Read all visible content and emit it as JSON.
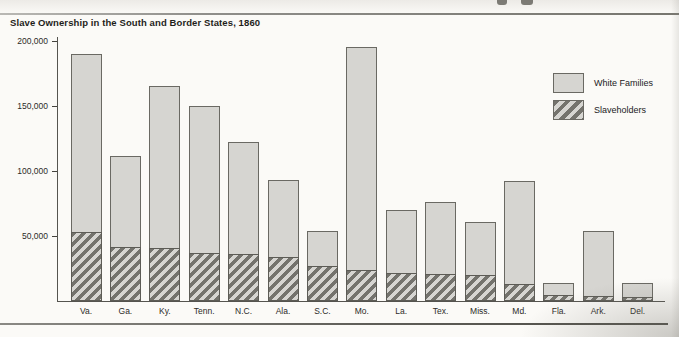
{
  "chart": {
    "title": "Slave Ownership in the South and Border States, 1860",
    "legend": [
      {
        "label": "White Families",
        "style": "solid",
        "color": "#d6d5d1"
      },
      {
        "label": "Slaveholders",
        "style": "hatched",
        "color": "#74736d"
      }
    ]
  },
  "chart_data": {
    "type": "bar",
    "subtype": "overlay-stacked",
    "title": "Slave Ownership in the South and Border States, 1860",
    "categories": [
      "Va.",
      "Ga.",
      "Ky.",
      "Tenn.",
      "N.C.",
      "Ala.",
      "S.C.",
      "Mo.",
      "La.",
      "Tex.",
      "Miss.",
      "Md.",
      "Fla.",
      "Ark.",
      "Del."
    ],
    "series": [
      {
        "name": "White Families",
        "values": [
          190000,
          111000,
          165000,
          150000,
          122000,
          93000,
          54000,
          195000,
          70000,
          76000,
          61000,
          92000,
          14000,
          54000,
          14000
        ]
      },
      {
        "name": "Slaveholders",
        "values": [
          52000,
          41000,
          40000,
          36000,
          35000,
          33000,
          26000,
          23000,
          21000,
          20000,
          19000,
          12000,
          4000,
          3000,
          2000
        ]
      }
    ],
    "xlabel": "",
    "ylabel": "",
    "ylim": [
      0,
      200000
    ],
    "yticks": [
      50000,
      100000,
      150000,
      200000
    ],
    "ytick_labels": [
      "50,000",
      "100,000",
      "150,000",
      "200,000"
    ],
    "grid": false,
    "legend_position": "upper right",
    "note_colors": {
      "bar_fill": "#d6d5d1",
      "hatch_dark": "#74736d",
      "axis": "#55544f"
    }
  }
}
